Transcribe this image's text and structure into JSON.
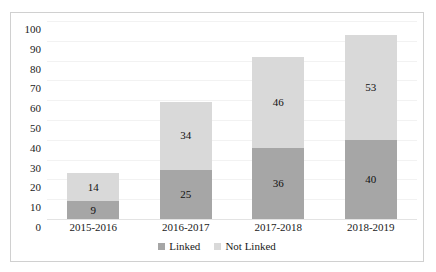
{
  "chart_data": {
    "type": "bar",
    "stacked": true,
    "orientation": "vertical",
    "title": "",
    "subtitle": "",
    "xlabel": "",
    "ylabel": "",
    "ylim": [
      0,
      100
    ],
    "ytick_step": 10,
    "yticks": [
      100,
      90,
      80,
      70,
      60,
      50,
      40,
      30,
      20,
      10,
      0
    ],
    "grid": true,
    "grid_axis": "y",
    "legend_position": "bottom-center",
    "categories": [
      "2015-2016",
      "2016-2017",
      "2017-2018",
      "2018-2019"
    ],
    "series": [
      {
        "name": "Linked",
        "color": "#A6A6A6",
        "values": [
          9,
          25,
          36,
          40
        ],
        "labels": [
          "9",
          "25",
          "36",
          "40"
        ]
      },
      {
        "name": "Not Linked",
        "color": "#D9D9D9",
        "values": [
          14,
          34,
          46,
          53
        ],
        "labels": [
          "14",
          "34",
          "46",
          "53"
        ]
      }
    ],
    "totals": [
      23,
      59,
      82,
      93
    ],
    "annotations": []
  },
  "legend": {
    "items": [
      {
        "label": "Linked",
        "color": "#A6A6A6"
      },
      {
        "label": "Not Linked",
        "color": "#D9D9D9"
      }
    ]
  },
  "colors": {
    "linked": "#A6A6A6",
    "not_linked": "#D9D9D9",
    "gridline": "#F2F2F2",
    "border": "#D0D0D0",
    "text": "#1A1A1A"
  }
}
